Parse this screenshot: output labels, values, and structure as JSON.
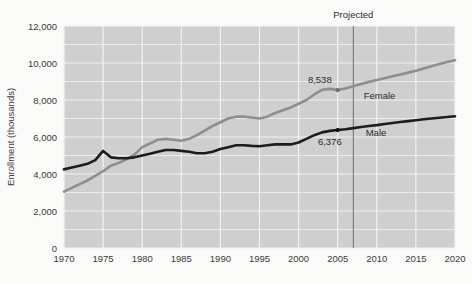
{
  "chart_data": {
    "type": "line",
    "title": "",
    "xlabel": "",
    "ylabel": "Enrollment (thousands)",
    "xlim": [
      1970,
      2020
    ],
    "ylim": [
      0,
      12000
    ],
    "grid": true,
    "legend": "inline-series-labels",
    "y_ticks": [
      "0",
      "2,000",
      "4,000",
      "6,000",
      "8,000",
      "10,000",
      "12,000"
    ],
    "y_tick_values": [
      0,
      2000,
      4000,
      6000,
      8000,
      10000,
      12000
    ],
    "x_ticks": [
      "1970",
      "1975",
      "1980",
      "1985",
      "1990",
      "1995",
      "2000",
      "2005",
      "2010",
      "2015",
      "2020"
    ],
    "x_tick_values": [
      1970,
      1975,
      1980,
      1985,
      1990,
      1995,
      2000,
      2005,
      2010,
      2015,
      2020
    ],
    "x": [
      1970,
      1971,
      1972,
      1973,
      1974,
      1975,
      1976,
      1977,
      1978,
      1979,
      1980,
      1981,
      1982,
      1983,
      1984,
      1985,
      1986,
      1987,
      1988,
      1989,
      1990,
      1991,
      1992,
      1993,
      1994,
      1995,
      1996,
      1997,
      1998,
      1999,
      2000,
      2001,
      2002,
      2003,
      2004,
      2005,
      2006,
      2007,
      2008,
      2009,
      2010,
      2011,
      2012,
      2013,
      2014,
      2015,
      2016,
      2017,
      2018,
      2019,
      2020
    ],
    "series": [
      {
        "name": "Female",
        "color": "#8e8e8e",
        "values": [
          3050,
          3250,
          3450,
          3650,
          3900,
          4150,
          4450,
          4600,
          4800,
          5050,
          5450,
          5650,
          5850,
          5900,
          5850,
          5800,
          5900,
          6100,
          6350,
          6600,
          6800,
          7000,
          7100,
          7100,
          7050,
          7000,
          7100,
          7300,
          7450,
          7600,
          7800,
          8000,
          8300,
          8550,
          8600,
          8538,
          8620,
          8750,
          8870,
          8980,
          9080,
          9180,
          9280,
          9380,
          9480,
          9580,
          9700,
          9820,
          9950,
          10050,
          10150
        ]
      },
      {
        "name": "Male",
        "color": "#1c1c1c",
        "values": [
          4250,
          4350,
          4450,
          4550,
          4750,
          5250,
          4900,
          4850,
          4850,
          4900,
          5000,
          5100,
          5200,
          5300,
          5300,
          5250,
          5200,
          5120,
          5120,
          5200,
          5350,
          5450,
          5550,
          5550,
          5520,
          5500,
          5550,
          5600,
          5600,
          5600,
          5700,
          5900,
          6100,
          6250,
          6330,
          6376,
          6420,
          6480,
          6540,
          6590,
          6640,
          6700,
          6760,
          6810,
          6860,
          6910,
          6960,
          7000,
          7040,
          7080,
          7120
        ]
      }
    ],
    "annotations": [
      {
        "name": "projected-divider",
        "label": "Projected",
        "x": 2007
      },
      {
        "name": "female-2005-value",
        "label": "8,538",
        "x": 2005,
        "y": 8538,
        "series": "Female"
      },
      {
        "name": "male-2005-value",
        "label": "6,376",
        "x": 2005,
        "y": 6376,
        "series": "Male"
      }
    ]
  },
  "labels": {
    "y_axis_title": "Enrollment (thousands)",
    "projected": "Projected",
    "female": "Female",
    "male": "Male",
    "female_value": "8,538",
    "male_value": "6,376",
    "y0": "0",
    "y2000": "2,000",
    "y4000": "4,000",
    "y6000": "6,000",
    "y8000": "8,000",
    "y10000": "10,000",
    "y12000": "12,000",
    "x1970": "1970",
    "x1975": "1975",
    "x1980": "1980",
    "x1985": "1985",
    "x1990": "1990",
    "x1995": "1995",
    "x2000": "2000",
    "x2005": "2005",
    "x2010": "2010",
    "x2015": "2015",
    "x2020": "2020"
  },
  "colors": {
    "page_background": "#fbfbfa",
    "plot_background": "#cfcfcf",
    "gridline": "#f2f2f0",
    "female_line": "#8e8e8e",
    "male_line": "#1c1c1c",
    "divider": "#6e6e6e",
    "text": "#2b2b2b"
  }
}
